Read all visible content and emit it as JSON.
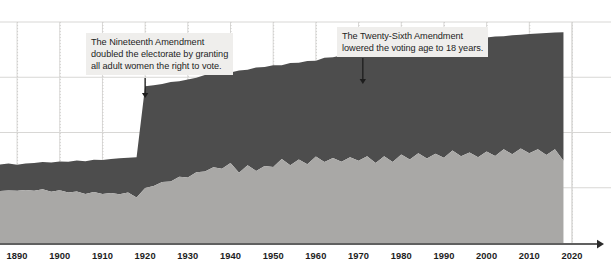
{
  "chart_data": {
    "type": "area",
    "title": "",
    "subtitle": "",
    "xlabel": "",
    "ylabel": "",
    "stacked": true,
    "grid": true,
    "legend_position": "none",
    "xlim": [
      1886,
      2020
    ],
    "ylim": [
      0,
      1.0
    ],
    "x_ticks": [
      1890,
      1900,
      1910,
      1920,
      1930,
      1940,
      1950,
      1960,
      1970,
      1980,
      1990,
      2000,
      2010,
      2020
    ],
    "x_tick_labels": [
      "1890",
      "1900",
      "1910",
      "1920",
      "1930",
      "1940",
      "1950",
      "1960",
      "1970",
      "1980",
      "1990",
      "2000",
      "2010",
      "2020"
    ],
    "y_gridlines": [
      0.25,
      0.5,
      0.75,
      1.0
    ],
    "y_tick_labels": [],
    "colors": {
      "series_lower": "#a9a8a6",
      "series_upper": "#4d4d4d",
      "background": "#ffffff",
      "gridline": "#d8d7d5",
      "gridline_dotted": "#cfcecc",
      "axis": "#2b2b2b",
      "annotation_background": "#efeeec",
      "annotation_text": "#1d1d1d",
      "arrow": "#1d1d1d"
    },
    "x": [
      1886,
      1888,
      1890,
      1892,
      1894,
      1896,
      1898,
      1900,
      1902,
      1904,
      1906,
      1908,
      1910,
      1912,
      1914,
      1916,
      1918,
      1920,
      1922,
      1924,
      1926,
      1928,
      1930,
      1932,
      1934,
      1936,
      1938,
      1940,
      1942,
      1944,
      1946,
      1948,
      1950,
      1952,
      1954,
      1956,
      1958,
      1960,
      1962,
      1964,
      1966,
      1968,
      1970,
      1972,
      1974,
      1976,
      1978,
      1980,
      1982,
      1984,
      1986,
      1988,
      1990,
      1992,
      1994,
      1996,
      1998,
      2000,
      2002,
      2004,
      2006,
      2008,
      2010,
      2012,
      2014,
      2016,
      2018
    ],
    "series": [
      {
        "name": "Voted",
        "color": "#a9a8a6",
        "values": [
          0.235,
          0.238,
          0.236,
          0.24,
          0.236,
          0.243,
          0.232,
          0.239,
          0.228,
          0.233,
          0.222,
          0.231,
          0.222,
          0.226,
          0.221,
          0.228,
          0.206,
          0.249,
          0.258,
          0.276,
          0.278,
          0.3,
          0.296,
          0.32,
          0.324,
          0.343,
          0.336,
          0.362,
          0.318,
          0.352,
          0.326,
          0.348,
          0.344,
          0.38,
          0.352,
          0.378,
          0.356,
          0.391,
          0.366,
          0.385,
          0.368,
          0.388,
          0.372,
          0.393,
          0.362,
          0.392,
          0.366,
          0.4,
          0.378,
          0.406,
          0.382,
          0.404,
          0.386,
          0.418,
          0.392,
          0.41,
          0.388,
          0.414,
          0.394,
          0.424,
          0.402,
          0.428,
          0.406,
          0.424,
          0.398,
          0.424,
          0.372
        ]
      },
      {
        "name": "Did not vote",
        "color": "#4d4d4d",
        "values": [
          0.12,
          0.122,
          0.118,
          0.12,
          0.126,
          0.124,
          0.132,
          0.13,
          0.14,
          0.14,
          0.148,
          0.146,
          0.154,
          0.154,
          0.162,
          0.158,
          0.182,
          0.46,
          0.456,
          0.444,
          0.45,
          0.432,
          0.444,
          0.428,
          0.436,
          0.42,
          0.432,
          0.41,
          0.462,
          0.432,
          0.468,
          0.448,
          0.46,
          0.424,
          0.462,
          0.438,
          0.468,
          0.434,
          0.472,
          0.456,
          0.48,
          0.462,
          0.486,
          0.498,
          0.534,
          0.506,
          0.538,
          0.506,
          0.532,
          0.506,
          0.534,
          0.512,
          0.534,
          0.502,
          0.532,
          0.514,
          0.54,
          0.516,
          0.54,
          0.512,
          0.538,
          0.514,
          0.54,
          0.524,
          0.552,
          0.528,
          0.582
        ]
      }
    ],
    "annotations": [
      {
        "id": "nineteenth-amendment",
        "text": "The Nineteenth Amendment\ndoubled the electorate by granting\nall adult women the right to vote.",
        "arrow_x_year": 1920,
        "arrow": "down-arrow"
      },
      {
        "id": "twenty-sixth-amendment",
        "text": "The Twenty-Sixth Amendment\nlowered the voting age to 18 years.",
        "arrow_x_year": 1971,
        "arrow": "down-arrow"
      }
    ]
  }
}
